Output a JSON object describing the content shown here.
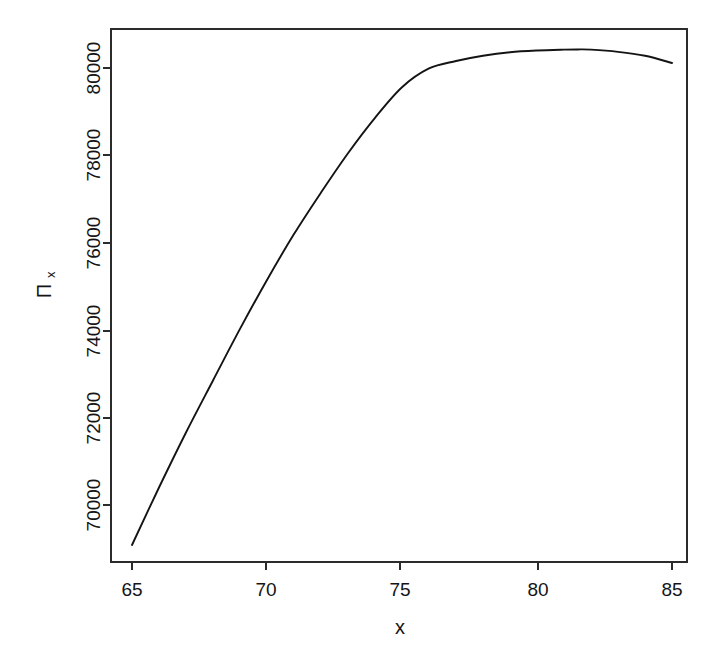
{
  "figure": {
    "background_color": "#ffffff",
    "line_color": "#141414",
    "axis_color": "#2b2b2b",
    "width": 719,
    "height": 662
  },
  "axis_titles": {
    "x": "x",
    "y_symbol": "Π",
    "y_subscript": "x"
  },
  "xticks": [
    {
      "label": "65",
      "value": 65
    },
    {
      "label": "70",
      "value": 70
    },
    {
      "label": "75",
      "value": 75
    },
    {
      "label": "80",
      "value": 80
    },
    {
      "label": "85",
      "value": 85
    }
  ],
  "yticks": [
    {
      "label": "70000",
      "value": 70000
    },
    {
      "label": "72000",
      "value": 72000
    },
    {
      "label": "74000",
      "value": 74000
    },
    {
      "label": "76000",
      "value": 76000
    },
    {
      "label": "78000",
      "value": 78000
    },
    {
      "label": "80000",
      "value": 80000
    }
  ],
  "chart_data": {
    "type": "line",
    "title": "",
    "xlabel": "x",
    "ylabel": "Πx",
    "xlim": [
      65,
      85
    ],
    "ylim": [
      68900,
      80650
    ],
    "grid": false,
    "legend": null,
    "series": [
      {
        "name": "Πx",
        "x": [
          65,
          66,
          67,
          68,
          69,
          70,
          71,
          72,
          73,
          74,
          75,
          76,
          77,
          78,
          79,
          80,
          81,
          81.5,
          82,
          83,
          84,
          85
        ],
        "y": [
          69085,
          70400,
          71660,
          72850,
          74030,
          75150,
          76200,
          77150,
          78050,
          78860,
          79560,
          79990,
          80160,
          80280,
          80360,
          80400,
          80420,
          80425,
          80420,
          80370,
          80280,
          80115
        ]
      }
    ]
  }
}
